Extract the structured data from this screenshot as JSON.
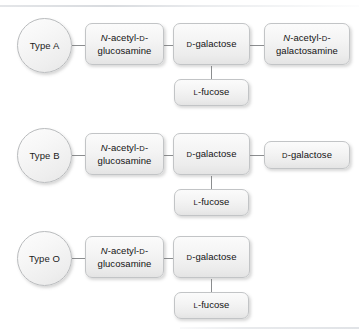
{
  "figure": {
    "background_color": "#ffffff",
    "node_fill": "#f2f2f2",
    "node_border": "#c2c4c6",
    "connector_color": "#8b8d8f",
    "text_color": "#131313"
  },
  "rows": [
    {
      "id": "type-a",
      "label": "Type A",
      "nodes": {
        "glcnac": {
          "line1_prefix_italic": "N",
          "line1_rest": "-acetyl-",
          "line1_smallcap": "D",
          "line1_suffix": "-",
          "line2": "glucosamine"
        },
        "galactose": {
          "smallcap": "D",
          "rest": "-galactose"
        },
        "terminal": {
          "line1_prefix_italic": "N",
          "line1_rest": "-acetyl-",
          "line1_smallcap": "D",
          "line1_suffix": "-",
          "line2": "galactosamine"
        },
        "fucose": {
          "smallcap": "L",
          "rest": "-fucose"
        }
      }
    },
    {
      "id": "type-b",
      "label": "Type B",
      "nodes": {
        "glcnac": {
          "line1_prefix_italic": "N",
          "line1_rest": "-acetyl-",
          "line1_smallcap": "D",
          "line1_suffix": "-",
          "line2": "glucosamine"
        },
        "galactose": {
          "smallcap": "D",
          "rest": "-galactose"
        },
        "terminal": {
          "smallcap": "D",
          "rest": "-galactose"
        },
        "fucose": {
          "smallcap": "L",
          "rest": "-fucose"
        }
      }
    },
    {
      "id": "type-o",
      "label": "Type O",
      "nodes": {
        "glcnac": {
          "line1_prefix_italic": "N",
          "line1_rest": "-acetyl-",
          "line1_smallcap": "D",
          "line1_suffix": "-",
          "line2": "glucosamine"
        },
        "galactose": {
          "smallcap": "D",
          "rest": "-galactose"
        },
        "fucose": {
          "smallcap": "L",
          "rest": "-fucose"
        }
      }
    }
  ]
}
